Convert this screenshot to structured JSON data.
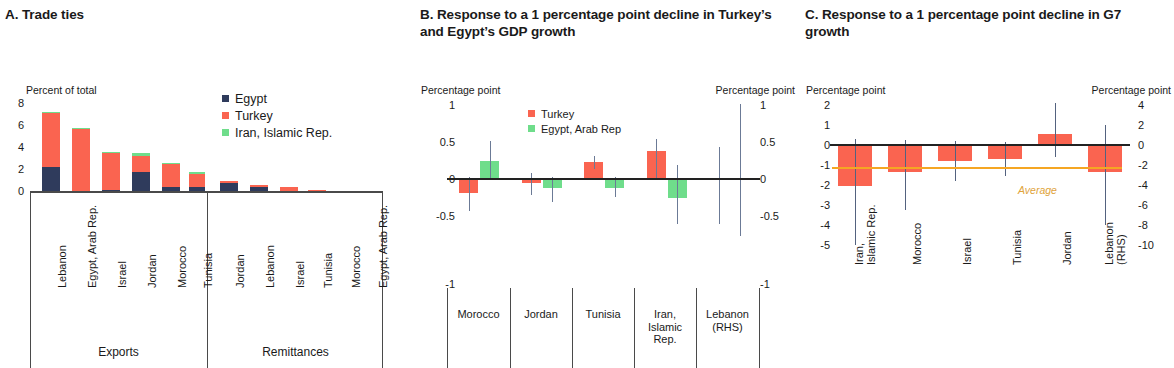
{
  "panels": {
    "a": {
      "title": "A. Trade ties",
      "y_axis_title": "Percent of total",
      "yticks": [
        "8",
        "6",
        "4",
        "2",
        "0"
      ],
      "legend": [
        {
          "label": "Egypt",
          "color": "#2f3b5c"
        },
        {
          "label": "Turkey",
          "color": "#fa6450"
        },
        {
          "label": "Iran, Islamic Rep.",
          "color": "#6fdd8b"
        }
      ],
      "group_labels": [
        "Exports",
        "Remittances"
      ]
    },
    "b": {
      "title": "B. Response to a 1 percentage point decline in Turkey’s and Egypt’s GDP growth",
      "y_axis_title_left": "Percentage point",
      "y_axis_title_right": "Percentage point",
      "yticks_left": [
        "1",
        "0.5",
        "0",
        "-0.5",
        "-1"
      ],
      "yticks_right": [
        "1",
        "0.5",
        "0",
        "-0.5",
        "-1"
      ],
      "legend": [
        {
          "label": "Turkey",
          "color": "#fa6450"
        },
        {
          "label": "Egypt, Arab Rep",
          "color": "#6fdd8b"
        }
      ]
    },
    "c": {
      "title": "C. Response to a 1 percentage point decline in G7 growth",
      "y_axis_title_left": "Percentage point",
      "y_axis_title_right": "Percentage point",
      "yticks_left": [
        "2",
        "1",
        "0",
        "-1",
        "-2",
        "-3",
        "-4",
        "-5"
      ],
      "yticks_right": [
        "4",
        "2",
        "0",
        "-2",
        "-4",
        "-6",
        "-8",
        "-10"
      ],
      "average_label": "Average",
      "average_color": "#f5a623"
    }
  },
  "chart_data": [
    {
      "type": "bar",
      "id": "panel-a",
      "title": "A. Trade ties",
      "subtype": "stacked",
      "ylabel": "Percent of total",
      "ylim": [
        0,
        8
      ],
      "yticks": [
        0,
        2,
        4,
        6,
        8
      ],
      "grid": false,
      "legend_position": "top-right",
      "groups": [
        "Exports",
        "Remittances"
      ],
      "categories": [
        "Lebanon",
        "Egypt, Arab Rep.",
        "Israel",
        "Jordan",
        "Morocco",
        "Tunisia",
        "Jordan",
        "Lebanon",
        "Israel",
        "Tunisia",
        "Morocco",
        "Egypt, Arab Rep."
      ],
      "category_group": [
        "Exports",
        "Exports",
        "Exports",
        "Exports",
        "Exports",
        "Exports",
        "Remittances",
        "Remittances",
        "Remittances",
        "Remittances",
        "Remittances",
        "Remittances"
      ],
      "series": [
        {
          "name": "Egypt",
          "color": "#2f3b5c",
          "values": [
            2.15,
            0.05,
            0.2,
            1.7,
            0.45,
            0.4,
            0.8,
            0.4,
            0.08,
            0.03,
            0.0,
            0.0
          ]
        },
        {
          "name": "Turkey",
          "color": "#fa6450",
          "values": [
            4.7,
            5.4,
            3.2,
            1.4,
            1.95,
            1.2,
            0.15,
            0.2,
            0.4,
            0.1,
            0.02,
            0.0
          ]
        },
        {
          "name": "Iran, Islamic Rep.",
          "color": "#6fdd8b",
          "values": [
            0.15,
            0.1,
            0.05,
            0.25,
            0.02,
            0.02,
            0.0,
            0.0,
            0.0,
            0.0,
            0.0,
            0.0
          ]
        }
      ]
    },
    {
      "type": "bar",
      "id": "panel-b",
      "title": "B. Response to a 1 percentage point decline in Turkey’s and Egypt’s GDP growth",
      "ylabel": "Percentage point",
      "ylabel_right": "Percentage point",
      "ylim": [
        -1,
        1
      ],
      "yticks": [
        -1,
        -0.5,
        0,
        0.5,
        1
      ],
      "yticks_right": [
        -1,
        -0.5,
        0,
        0.5,
        1
      ],
      "grid": false,
      "legend_position": "top-center",
      "categories": [
        "Morocco",
        "Jordan",
        "Tunisia",
        "Iran, Islamic Rep.",
        "Lebanon (RHS)"
      ],
      "series": [
        {
          "name": "Turkey",
          "color": "#fa6450",
          "values": [
            -0.2,
            -0.07,
            0.22,
            0.37,
            -0.02
          ],
          "err_low": [
            -0.45,
            -0.23,
            0.12,
            0.0,
            -0.62
          ],
          "err_high": [
            0.02,
            0.07,
            0.3,
            0.53,
            0.42
          ]
        },
        {
          "name": "Egypt, Arab Rep",
          "color": "#6fdd8b",
          "values": [
            0.23,
            -0.14,
            -0.13,
            -0.27,
            0.0
          ],
          "err_low": [
            0.0,
            -0.33,
            -0.26,
            -0.62,
            -0.78
          ],
          "err_high": [
            0.5,
            0.02,
            0.02,
            0.18,
            1.0
          ]
        }
      ]
    },
    {
      "type": "bar",
      "id": "panel-c",
      "title": "C. Response to a 1 percentage point decline in G7 growth",
      "ylabel": "Percentage point",
      "ylabel_right": "Percentage point",
      "ylim": [
        -5,
        2
      ],
      "yticks": [
        2,
        1,
        0,
        -1,
        -2,
        -3,
        -4,
        -5
      ],
      "ylim_right": [
        -10,
        4
      ],
      "yticks_right": [
        4,
        2,
        0,
        -2,
        -4,
        -6,
        -8,
        -10
      ],
      "grid": false,
      "categories": [
        "Iran, Islamic Rep.",
        "Morocco",
        "Israel",
        "Tunisia",
        "Jordan",
        "Lebanon (RHS)"
      ],
      "series": [
        {
          "name": "Response",
          "color": "#fa6450",
          "values": [
            -2.05,
            -1.35,
            -0.8,
            -0.7,
            0.55,
            -2.7
          ],
          "err_low": [
            -5.0,
            -3.25,
            -1.8,
            -1.55,
            -0.6,
            -8.0
          ],
          "err_high": [
            0.3,
            0.25,
            0.2,
            0.15,
            2.1,
            2.0
          ]
        }
      ],
      "reference_line": {
        "label": "Average",
        "value": -1.1,
        "color": "#f5a623"
      }
    }
  ]
}
